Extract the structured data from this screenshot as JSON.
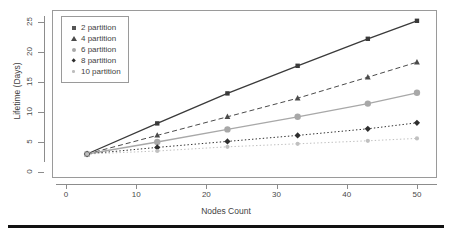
{
  "chart_data": {
    "type": "line",
    "title": "",
    "subtitle": "",
    "xlabel": "Nodes Count",
    "ylabel": "Lifetime (Days)",
    "x": [
      3,
      13,
      23,
      33,
      43,
      50
    ],
    "xlim": [
      0,
      52
    ],
    "ylim": [
      0,
      26
    ],
    "xticks": [
      0,
      10,
      20,
      30,
      40,
      50
    ],
    "yticks": [
      0,
      5,
      10,
      15,
      20,
      25
    ],
    "grid": false,
    "legend_position": "upper-left",
    "series": [
      {
        "name": "2 partition",
        "values": [
          3.0,
          8.1,
          13.1,
          17.7,
          22.2,
          25.2
        ],
        "marker": "square",
        "linestyle": "solid",
        "color": "#3a3a3a"
      },
      {
        "name": "4 partition",
        "values": [
          3.0,
          6.1,
          9.2,
          12.3,
          15.8,
          18.3
        ],
        "marker": "triangle",
        "linestyle": "dashed",
        "color": "#4a4a4a"
      },
      {
        "name": "6 partition",
        "values": [
          3.0,
          5.0,
          7.1,
          9.2,
          11.4,
          13.2
        ],
        "marker": "circle",
        "linestyle": "solid",
        "color": "#a8a8a8"
      },
      {
        "name": "8 partition",
        "values": [
          3.0,
          4.1,
          5.1,
          6.1,
          7.2,
          8.2
        ],
        "marker": "diamond",
        "linestyle": "dotted",
        "color": "#2e2e2e"
      },
      {
        "name": "10 partition",
        "values": [
          3.0,
          3.5,
          4.2,
          4.7,
          5.2,
          5.6
        ],
        "marker": "dot",
        "linestyle": "dotted",
        "color": "#c0c0c0"
      }
    ]
  },
  "axes": {
    "xtick_labels": [
      "0",
      "10",
      "20",
      "30",
      "40",
      "50"
    ],
    "ytick_labels": [
      "0",
      "5",
      "10",
      "15",
      "20",
      "25"
    ],
    "x_title": "Nodes Count",
    "y_title": "Lifetime (Days)"
  },
  "legend": {
    "items": [
      {
        "label": "2 partition",
        "marker": "square"
      },
      {
        "label": "4 partition",
        "marker": "triangle"
      },
      {
        "label": "6 partition",
        "marker": "circle"
      },
      {
        "label": "8 partition",
        "marker": "diamond"
      },
      {
        "label": "10 partition",
        "marker": "dot"
      }
    ]
  }
}
